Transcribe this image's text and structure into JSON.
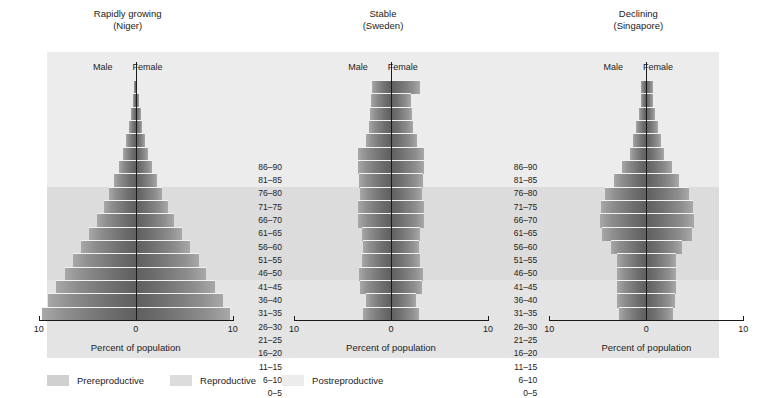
{
  "legend": {
    "items": [
      {
        "label": "Prereproductive",
        "color": "#d0d0d0"
      },
      {
        "label": "Reproductive",
        "color": "#dcdcdc"
      },
      {
        "label": "Postreproductive",
        "color": "#ececec"
      }
    ]
  },
  "axis": {
    "title": "Percent of population",
    "ticks": [
      "10",
      "0",
      "10"
    ],
    "male_label": "Male",
    "female_label": "Female"
  },
  "age_groups": [
    "86–90",
    "81–85",
    "76–80",
    "71–75",
    "66–70",
    "61–65",
    "56–60",
    "51–55",
    "46–50",
    "41–45",
    "36–40",
    "31–35",
    "26–30",
    "21–25",
    "16–20",
    "11–15",
    "6–10",
    "0–5"
  ],
  "chart_data": {
    "type": "bar",
    "xlabel": "Percent of population",
    "ylabel": "Age group (years)",
    "xlim": [
      -10,
      10
    ],
    "xticks": [
      10,
      0,
      10
    ],
    "grid": false,
    "legend_position": "bottom-left",
    "orientation": "horizontal-diverging",
    "categories": [
      "86–90",
      "81–85",
      "76–80",
      "71–75",
      "66–70",
      "61–65",
      "56–60",
      "51–55",
      "46–50",
      "41–45",
      "36–40",
      "31–35",
      "26–30",
      "21–25",
      "16–20",
      "11–15",
      "6–10",
      "0–5"
    ],
    "life_stages": {
      "postreproductive": [
        "86–90",
        "81–85",
        "76–80",
        "71–75",
        "66–70",
        "61–65",
        "56–60",
        "51–55"
      ],
      "reproductive": [
        "46–50",
        "41–45",
        "36–40",
        "31–35",
        "26–30",
        "21–25",
        "16–20"
      ],
      "prereproductive": [
        "11–15",
        "6–10",
        "0–5"
      ]
    },
    "panels": [
      {
        "name": "Rapidly growing",
        "country": "(Niger)",
        "series": [
          {
            "name": "Male",
            "values": [
              0.15,
              0.3,
              0.5,
              0.7,
              0.95,
              1.3,
              1.7,
              2.2,
              2.7,
              3.3,
              4.0,
              4.8,
              5.6,
              6.5,
              7.3,
              8.2,
              9.0,
              9.7
            ]
          },
          {
            "name": "Female",
            "values": [
              0.15,
              0.3,
              0.5,
              0.7,
              0.95,
              1.3,
              1.7,
              2.2,
              2.7,
              3.3,
              4.0,
              4.8,
              5.6,
              6.5,
              7.3,
              8.2,
              9.0,
              9.7
            ]
          }
        ]
      },
      {
        "name": "Stable",
        "country": "(Sweden)",
        "series": [
          {
            "name": "Male",
            "values": [
              2.0,
              2.1,
              2.2,
              2.3,
              2.6,
              3.4,
              3.4,
              3.3,
              3.2,
              3.4,
              3.4,
              3.0,
              2.9,
              3.0,
              3.3,
              3.2,
              2.6,
              2.9
            ]
          },
          {
            "name": "Female",
            "values": [
              3.0,
              2.1,
              2.2,
              2.3,
              2.7,
              3.4,
              3.4,
              3.3,
              3.2,
              3.4,
              3.4,
              3.0,
              2.9,
              3.0,
              3.3,
              3.2,
              2.6,
              2.9
            ]
          }
        ]
      },
      {
        "name": "Declining",
        "country": "(Singapore)",
        "series": [
          {
            "name": "Male",
            "values": [
              0.5,
              0.6,
              0.8,
              1.1,
              1.4,
              1.7,
              2.5,
              3.3,
              4.3,
              4.7,
              4.8,
              4.6,
              3.6,
              3.0,
              3.0,
              3.0,
              3.0,
              2.8
            ]
          },
          {
            "name": "Female",
            "values": [
              0.7,
              0.7,
              0.9,
              1.2,
              1.5,
              1.8,
              2.6,
              3.4,
              4.4,
              4.8,
              4.9,
              4.7,
              3.7,
              3.1,
              3.1,
              3.1,
              3.0,
              2.8
            ]
          }
        ]
      }
    ]
  }
}
